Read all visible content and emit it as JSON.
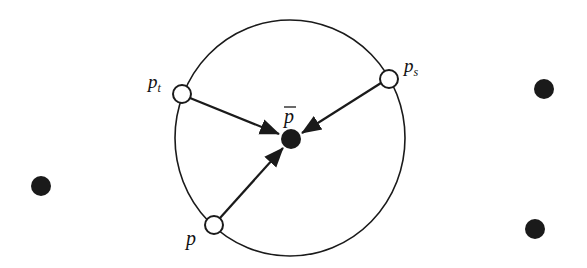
{
  "diagram": {
    "title": "",
    "colors": {
      "stroke": "#1a1a1a",
      "fill_dark": "#1a1a1a",
      "fill_open": "#ffffff",
      "background": "#ffffff"
    },
    "labels": {
      "p": {
        "base": "p",
        "sub": ""
      },
      "pt": {
        "base": "p",
        "sub": "t"
      },
      "ps": {
        "base": "p",
        "sub": "s"
      },
      "pbar": {
        "base": "p",
        "sub": "",
        "overline": true
      }
    },
    "nodes": [
      {
        "id": "p",
        "kind": "open",
        "label": "p"
      },
      {
        "id": "pt",
        "kind": "open",
        "label": "pt"
      },
      {
        "id": "ps",
        "kind": "open",
        "label": "ps"
      },
      {
        "id": "pbar",
        "kind": "filled",
        "label": "pbar"
      },
      {
        "id": "out-left",
        "kind": "filled",
        "label": ""
      },
      {
        "id": "out-top-right",
        "kind": "filled",
        "label": ""
      },
      {
        "id": "out-bottom-right",
        "kind": "filled",
        "label": ""
      }
    ],
    "edges": [
      {
        "from": "pt",
        "to": "pbar",
        "arrow": true
      },
      {
        "from": "ps",
        "to": "pbar",
        "arrow": true
      },
      {
        "from": "p",
        "to": "pbar",
        "arrow": true
      }
    ]
  }
}
